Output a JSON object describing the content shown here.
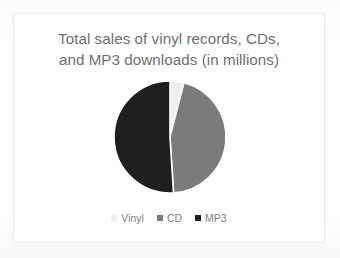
{
  "card": {
    "background": "#ffffff",
    "border_color": "#ececec"
  },
  "chart_data": {
    "type": "pie",
    "title": "Total sales of vinyl records, CDs,\nand MP3 downloads (in millions)",
    "title_line_1": "Total sales of vinyl records, CDs,",
    "title_line_2": "and MP3 downloads (in millions)",
    "xlabel": "",
    "ylabel": "",
    "grid": false,
    "legend_position": "bottom",
    "start_angle_deg": 0,
    "direction": "clockwise",
    "categories": [
      "Vinyl",
      "CD",
      "MP3"
    ],
    "values": [
      4,
      45,
      51
    ],
    "unit": "millions",
    "slices": [
      {
        "label": "Vinyl",
        "value": 4,
        "percent": 4,
        "start_angle_deg": 0,
        "end_angle_deg": 14.4,
        "color": "#ededed"
      },
      {
        "label": "CD",
        "value": 45,
        "percent": 45,
        "start_angle_deg": 14.4,
        "end_angle_deg": 176.4,
        "color": "#7b7b7b"
      },
      {
        "label": "MP3",
        "value": 51,
        "percent": 51,
        "start_angle_deg": 176.4,
        "end_angle_deg": 360,
        "color": "#201f1f"
      }
    ],
    "colors": [
      "#ededed",
      "#7b7b7b",
      "#201f1f"
    ],
    "legend": [
      {
        "label": "Vinyl",
        "color": "#ededed"
      },
      {
        "label": "CD",
        "color": "#7b7b7b"
      },
      {
        "label": "MP3",
        "color": "#201f1f"
      }
    ],
    "geometry": {
      "center_x": 156,
      "center_y": 65,
      "radius": 56,
      "separator_color": "#ffffff",
      "separator_width": 1.6
    },
    "title_color": "#6f6f6f",
    "legend_text_color": "#808080"
  }
}
